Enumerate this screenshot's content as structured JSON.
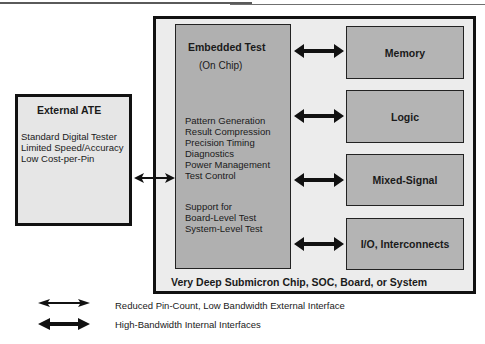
{
  "diagram": {
    "external_ate": {
      "title": "External ATE",
      "lines": [
        "Standard Digital Tester",
        "Limited Speed/Accuracy",
        "Low Cost-per-Pin"
      ]
    },
    "embedded_test": {
      "title": "Embedded Test",
      "subtitle": "(On Chip)",
      "functions": [
        "Pattern Generation",
        "Result Compression",
        "Precision Timing",
        "Diagnostics",
        "Power Management",
        "Test Control"
      ],
      "support": [
        "Support for",
        "Board-Level Test",
        "System-Level Test"
      ]
    },
    "blocks": [
      {
        "label": "Memory"
      },
      {
        "label": "Logic"
      },
      {
        "label": "Mixed-Signal"
      },
      {
        "label": "I/O, Interconnects"
      }
    ],
    "container_label": "Very Deep Submicron Chip, SOC, Board, or System",
    "legend": [
      {
        "icon": "thin-double-arrow",
        "label": "Reduced Pin-Count, Low Bandwidth External Interface"
      },
      {
        "icon": "thick-double-arrow",
        "label": "High-Bandwidth Internal Interfaces"
      }
    ],
    "colors": {
      "outline": "#111111",
      "outer_fill": "#ececec",
      "ate_fill": "#e6e6e6",
      "embedded_fill": "#b0b0b0",
      "block_fill": "#b4b4b4"
    }
  }
}
